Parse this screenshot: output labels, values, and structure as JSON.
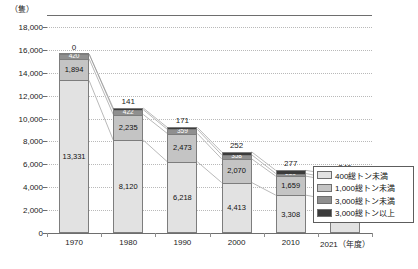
{
  "chart_data": {
    "type": "bar",
    "stacked": true,
    "title": "",
    "subtitle": "",
    "unit_label": "（隻）",
    "xlabel": "（年度）",
    "ylabel": "",
    "categories": [
      "1970",
      "1980",
      "1990",
      "2000",
      "2010",
      "2021"
    ],
    "x_axis_suffix_label": "2021（年度）",
    "ylim": [
      0,
      18000
    ],
    "ytick_step": 2000,
    "yticks": [
      "0",
      "2,000",
      "4,000",
      "6,000",
      "8,000",
      "10,000",
      "12,000",
      "14,000",
      "16,000",
      "18,000"
    ],
    "ytick_values": [
      0,
      2000,
      4000,
      6000,
      8000,
      10000,
      12000,
      14000,
      16000,
      18000
    ],
    "grid": true,
    "legend_position": "bottom-right",
    "series": [
      {
        "name": "400総トン未満",
        "color": "#e2e2e2",
        "values": [
          13331,
          8120,
          6218,
          4413,
          3308,
          2915
        ],
        "labels": [
          "13,331",
          "8,120",
          "6,218",
          "4,413",
          "3,308",
          "2,915"
        ]
      },
      {
        "name": "1,000総トン未満",
        "color": "#c4c4c4",
        "values": [
          1894,
          2235,
          2473,
          2070,
          1659,
          1684
        ],
        "labels": [
          "1,894",
          "2,235",
          "2,473",
          "2,070",
          "1,659",
          "1,684"
        ]
      },
      {
        "name": "3,000総トン未満",
        "color": "#8f8f8f",
        "values": [
          420,
          422,
          359,
          358,
          229,
          193
        ],
        "labels": [
          "420",
          "422",
          "359",
          "358",
          "229",
          "193"
        ]
      },
      {
        "name": "3,000総トン以上",
        "color": "#3b3b3b",
        "values": [
          0,
          141,
          171,
          252,
          277,
          346
        ],
        "labels": [
          "0",
          "141",
          "171",
          "252",
          "277",
          "346"
        ]
      }
    ]
  },
  "legend": {
    "items": [
      {
        "label": "400総トン未満",
        "color": "#e2e2e2"
      },
      {
        "label": "1,000総トン未満",
        "color": "#c4c4c4"
      },
      {
        "label": "3,000総トン未満",
        "color": "#8f8f8f"
      },
      {
        "label": "3,000総トン以上",
        "color": "#3b3b3b"
      }
    ]
  }
}
